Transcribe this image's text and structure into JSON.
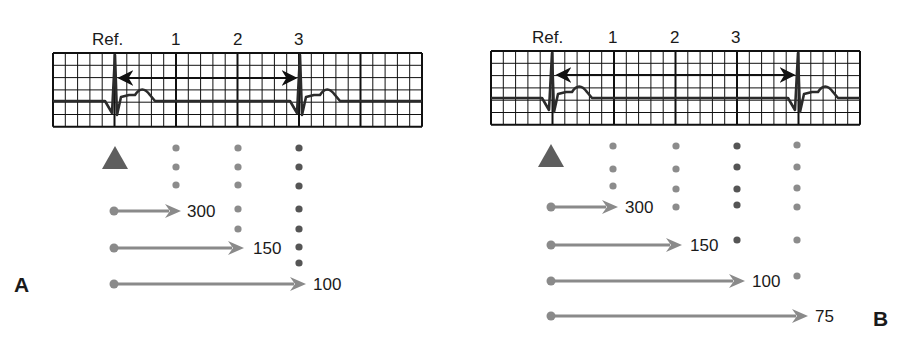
{
  "figure": {
    "colors": {
      "grid_line": "#111111",
      "ecg_trace": "#2b2b2b",
      "triangle": "#5e5e5e",
      "arrow": "#8a8a8a",
      "dot_light": "#8c8c8c",
      "dot_dark": "#555555",
      "text": "#1a1a1a"
    }
  },
  "panels": [
    {
      "id": "A",
      "letter": "A",
      "letter_pos": [
        14,
        292
      ],
      "grid": {
        "x": 53,
        "y": 53,
        "big_boxes": 6,
        "rows": 6,
        "small_per_big": 5,
        "small": 12.3
      },
      "column_labels": [
        {
          "text": "Ref.",
          "x": 92,
          "y": 45
        },
        {
          "text": "1",
          "x": 171,
          "y": 45
        },
        {
          "text": "2",
          "x": 233,
          "y": 45
        },
        {
          "text": "3",
          "x": 294,
          "y": 45
        }
      ],
      "r_peaks": [
        115,
        300
      ],
      "rr_arrow": {
        "x1": 119,
        "x2": 296,
        "y": 78
      },
      "baseline_y": 101,
      "triangle": {
        "cx": 115,
        "top": 146,
        "bottom": 169,
        "half": 13
      },
      "dot_columns": [
        {
          "x": 176,
          "ys": [
            148,
            167,
            185
          ],
          "shade": "light"
        },
        {
          "x": 238,
          "ys": [
            148,
            167,
            185,
            209,
            229
          ],
          "shade": "light"
        },
        {
          "x": 299,
          "ys": [
            148,
            167,
            186,
            209,
            229,
            247,
            263
          ],
          "shade": "dark"
        }
      ],
      "rate_arrows": [
        {
          "label": "300",
          "x1": 114,
          "x2": 181,
          "y": 211,
          "label_x": 187
        },
        {
          "label": "150",
          "x1": 114,
          "x2": 244,
          "y": 248,
          "label_x": 253
        },
        {
          "label": "100",
          "x1": 114,
          "x2": 306,
          "y": 284,
          "label_x": 313
        }
      ]
    },
    {
      "id": "B",
      "letter": "B",
      "letter_pos": [
        873,
        326
      ],
      "grid": {
        "x": 491,
        "y": 51,
        "big_boxes": 6,
        "rows": 6,
        "small_per_big": 5,
        "small": 12.3
      },
      "column_labels": [
        {
          "text": "Ref.",
          "x": 532,
          "y": 43
        },
        {
          "text": "1",
          "x": 608,
          "y": 43
        },
        {
          "text": "2",
          "x": 670,
          "y": 43
        },
        {
          "text": "3",
          "x": 731,
          "y": 43
        }
      ],
      "r_peaks": [
        552,
        798
      ],
      "rr_arrow": {
        "x1": 557,
        "x2": 794,
        "y": 75
      },
      "baseline_y": 98,
      "triangle": {
        "cx": 551,
        "top": 144,
        "bottom": 167,
        "half": 13
      },
      "dot_columns": [
        {
          "x": 613,
          "ys": [
            146,
            169,
            186
          ],
          "shade": "light"
        },
        {
          "x": 676,
          "ys": [
            146,
            169,
            189,
            207
          ],
          "shade": "light"
        },
        {
          "x": 737,
          "ys": [
            146,
            167,
            189,
            205,
            240
          ],
          "shade": "dark"
        },
        {
          "x": 797,
          "ys": [
            145,
            167,
            188,
            207,
            240,
            276
          ],
          "shade": "light"
        }
      ],
      "rate_arrows": [
        {
          "label": "300",
          "x1": 551,
          "x2": 618,
          "y": 207,
          "label_x": 625
        },
        {
          "label": "150",
          "x1": 551,
          "x2": 682,
          "y": 245,
          "label_x": 690
        },
        {
          "label": "100",
          "x1": 551,
          "x2": 745,
          "y": 281,
          "label_x": 752
        },
        {
          "label": "75",
          "x1": 551,
          "x2": 808,
          "y": 316,
          "label_x": 815
        }
      ]
    }
  ]
}
